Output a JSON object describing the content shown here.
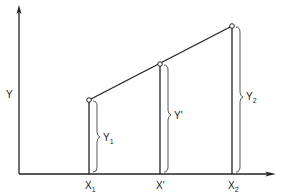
{
  "diagram": {
    "type": "linear-interpolation",
    "axes": {
      "y_label": "Y",
      "x_arrow": true,
      "y_arrow": true
    },
    "points": [
      {
        "id": "p1",
        "x_label": "X",
        "x_sub": "1",
        "y_label": "Y",
        "y_sub": "1"
      },
      {
        "id": "pprime",
        "x_label": "X'",
        "x_sub": "",
        "y_label": "Y'",
        "y_sub": ""
      },
      {
        "id": "p2",
        "x_label": "X",
        "x_sub": "2",
        "y_label": "Y",
        "y_sub": "2"
      }
    ],
    "colors": {
      "line": "#222222",
      "brace": "#444444",
      "background": "#ffffff"
    }
  }
}
